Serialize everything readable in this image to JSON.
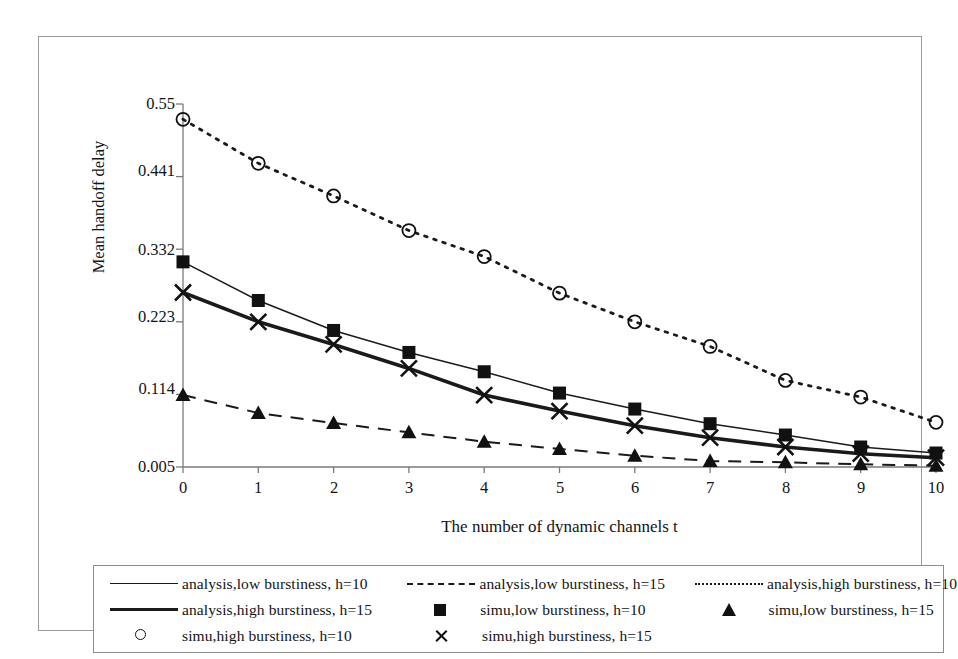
{
  "chart_data": {
    "type": "line",
    "title": "",
    "xlabel": "The number of dynamic channels t",
    "ylabel": "Mean handoff delay",
    "x": [
      0,
      1,
      2,
      3,
      4,
      5,
      6,
      7,
      8,
      9,
      10
    ],
    "xtick_labels": [
      "0",
      "1",
      "2",
      "3",
      "4",
      "5",
      "6",
      "7",
      "8",
      "9",
      "10"
    ],
    "ytick_labels": [
      "0.55",
      "0.441",
      "0.332",
      "0.223",
      "0.114",
      "0.005"
    ],
    "ytick_values": [
      0.55,
      0.441,
      0.332,
      0.223,
      0.114,
      0.005
    ],
    "xlim": [
      0,
      10
    ],
    "ylim": [
      0.005,
      0.55
    ],
    "grid": false,
    "legend_position": "below-plot",
    "series": [
      {
        "name": "analysis,low burstiness, h=10",
        "style": "solid-thin",
        "marker": "none",
        "color": "#1a1a1a",
        "values": [
          0.313,
          0.255,
          0.21,
          0.177,
          0.148,
          0.116,
          0.092,
          0.07,
          0.053,
          0.035,
          0.026
        ]
      },
      {
        "name": "analysis,low burstiness, h=15",
        "style": "dashed",
        "marker": "none",
        "color": "#1a1a1a",
        "values": [
          0.113,
          0.086,
          0.071,
          0.057,
          0.043,
          0.032,
          0.022,
          0.014,
          0.012,
          0.009,
          0.007
        ]
      },
      {
        "name": "analysis,high burstiness, h=10",
        "style": "dotted",
        "marker": "none",
        "color": "#1a1a1a",
        "values": [
          0.527,
          0.461,
          0.412,
          0.36,
          0.321,
          0.266,
          0.223,
          0.186,
          0.135,
          0.11,
          0.072
        ]
      },
      {
        "name": "analysis,high burstiness, h=15",
        "style": "solid-thick",
        "marker": "none",
        "color": "#1a1a1a",
        "values": [
          0.267,
          0.223,
          0.189,
          0.153,
          0.113,
          0.089,
          0.067,
          0.049,
          0.035,
          0.025,
          0.019
        ]
      },
      {
        "name": "simu,low burstiness, h=10",
        "style": "none",
        "marker": "square",
        "color": "#111111",
        "values": [
          0.313,
          0.255,
          0.21,
          0.177,
          0.148,
          0.116,
          0.092,
          0.07,
          0.053,
          0.035,
          0.026
        ]
      },
      {
        "name": "simu,low burstiness, h=15",
        "style": "none",
        "marker": "triangle",
        "color": "#111111",
        "values": [
          0.113,
          0.086,
          0.071,
          0.057,
          0.043,
          0.032,
          0.022,
          0.014,
          0.012,
          0.009,
          0.007
        ]
      },
      {
        "name": "simu,high burstiness, h=10",
        "style": "none",
        "marker": "circle",
        "color": "#111111",
        "values": [
          0.527,
          0.461,
          0.412,
          0.36,
          0.321,
          0.266,
          0.223,
          0.186,
          0.135,
          0.11,
          0.072
        ]
      },
      {
        "name": "simu,high burstiness, h=15",
        "style": "none",
        "marker": "cross",
        "color": "#111111",
        "values": [
          0.267,
          0.223,
          0.189,
          0.153,
          0.113,
          0.089,
          0.067,
          0.049,
          0.035,
          0.025,
          0.019
        ]
      }
    ]
  },
  "axes": {
    "y_title": "Mean handoff delay",
    "x_title": "The number of dynamic channels t",
    "yticks": [
      "0.55",
      "0.441",
      "0.332",
      "0.223",
      "0.114",
      "0.005"
    ],
    "xticks": [
      "0",
      "1",
      "2",
      "3",
      "4",
      "5",
      "6",
      "7",
      "8",
      "9",
      "10"
    ]
  },
  "legend": {
    "rows": [
      [
        {
          "key": "solid-thin-line",
          "label": "analysis,low burstiness, h=10"
        },
        {
          "key": "dashed-line",
          "label": "analysis,low burstiness, h=15"
        },
        {
          "key": "dotted-line",
          "label": "analysis,high burstiness, h=10"
        }
      ],
      [
        {
          "key": "solid-thick-line",
          "label": "analysis,high burstiness, h=15"
        },
        {
          "key": "filled-square-marker",
          "label": "simu,low burstiness, h=10"
        },
        {
          "key": "filled-triangle-marker",
          "label": "simu,low burstiness, h=15"
        }
      ],
      [
        {
          "key": "open-circle-marker",
          "label": "simu,high burstiness, h=10"
        },
        {
          "key": "cross-marker",
          "label": "simu,high burstiness, h=15"
        }
      ]
    ]
  },
  "colors": {
    "ink": "#1a1a1a",
    "axis": "#7a7a7a",
    "frame": "#9a9a9a",
    "background": "#ffffff"
  }
}
